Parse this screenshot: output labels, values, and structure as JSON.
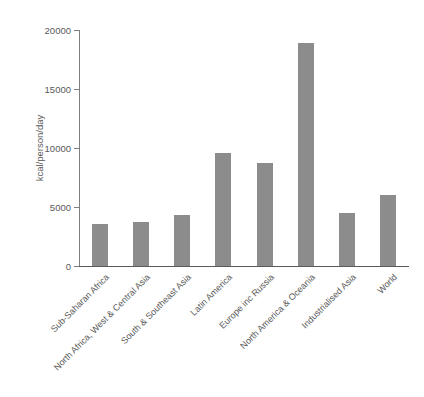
{
  "chart_data": {
    "type": "bar",
    "title": "",
    "subtitle": "",
    "xlabel": "",
    "ylabel": "kcal/person/day",
    "categories": [
      "Sub-Saharan Africa",
      "North Africa, West & Central Asia",
      "South & Southeast Asia",
      "Latin America",
      "Europe inc Russia",
      "North America & Oceania",
      "Industrialised Asia",
      "World"
    ],
    "values": [
      3600,
      3750,
      4300,
      9600,
      8700,
      18900,
      4500,
      6000
    ],
    "ylim": [
      0,
      20000
    ],
    "ytick_labels": [
      "20000",
      "15000",
      "10000",
      "5000",
      "0"
    ],
    "ytick_values": [
      20000,
      15000,
      10000,
      5000,
      0
    ],
    "grid": false,
    "legend": null,
    "bar_color": "#8c8c8c",
    "axis_color": "#595959",
    "background_color": "#ffffff"
  }
}
